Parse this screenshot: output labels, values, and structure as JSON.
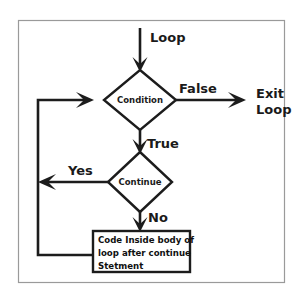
{
  "figure": {
    "background_color": "#ffffff",
    "frame_color": "#9a9a9a",
    "stroke_color": "#1c1c1c"
  },
  "nodes": {
    "condition": {
      "label": "Condition",
      "shape": "diamond"
    },
    "continue": {
      "label": "Continue",
      "shape": "diamond"
    },
    "body_box": {
      "shape": "rectangle",
      "lines": [
        "Code Inside body of",
        "loop after continue",
        "Stetment"
      ]
    }
  },
  "labels": {
    "loop": "Loop",
    "false": "False",
    "exit_loop_line1": "Exit",
    "exit_loop_line2": "Loop",
    "true": "True",
    "yes": "Yes",
    "no": "No"
  }
}
